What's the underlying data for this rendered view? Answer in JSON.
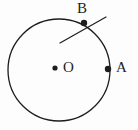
{
  "figure": {
    "name": "circle-with-points-and-secant",
    "background_color": "#fdfdfd",
    "stroke_color": "#1d1d1d",
    "width": 138,
    "height": 130
  },
  "circle": {
    "name": "main-circle",
    "center_x": 59,
    "center_y": 70,
    "radius": 51,
    "stroke_width": 1.3
  },
  "center_dot": {
    "name": "center-point-O",
    "cx": 55,
    "cy": 68,
    "r": 2.6
  },
  "points": [
    {
      "id": "A",
      "label": "A",
      "cx": 108,
      "cy": 69,
      "r": 3.2,
      "label_x": 116,
      "label_y": 60
    },
    {
      "id": "B",
      "label": "B",
      "cx": 84,
      "cy": 23,
      "r": 3.2,
      "label_x": 77,
      "label_y": 1
    }
  ],
  "center_label": {
    "text": "O",
    "x": 63,
    "y": 60
  },
  "secant_line": {
    "name": "line-through-B",
    "x1": 60,
    "y1": 43,
    "x2": 106,
    "y2": 17,
    "stroke_width": 1.2
  }
}
